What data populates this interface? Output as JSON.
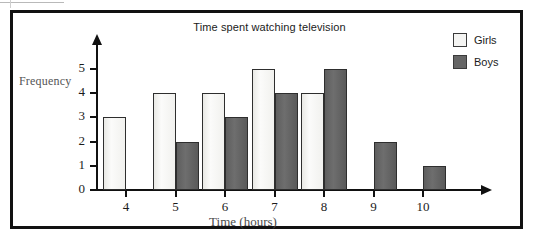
{
  "chart_data": {
    "type": "bar",
    "title": "Time spent watching television",
    "xlabel": "Time (hours)",
    "ylabel": "Frequency",
    "categories": [
      "4",
      "5",
      "6",
      "7",
      "8",
      "9",
      "10"
    ],
    "series": [
      {
        "name": "Girls",
        "color": "#f4f4f2",
        "values": [
          3,
          4,
          4,
          5,
          4,
          0,
          0
        ]
      },
      {
        "name": "Boys",
        "color": "#666666",
        "values": [
          0,
          2,
          3,
          4,
          5,
          2,
          1
        ]
      }
    ],
    "ytick_labels": [
      "5",
      "4",
      "3",
      "2",
      "1",
      "0"
    ],
    "ylim": [
      0,
      5
    ],
    "grid": false,
    "legend_position": "top-right"
  },
  "legend": {
    "items": [
      {
        "label": "Girls"
      },
      {
        "label": "Boys"
      }
    ]
  }
}
